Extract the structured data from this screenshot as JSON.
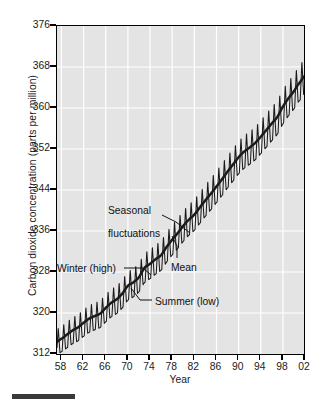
{
  "chart_data": {
    "type": "line",
    "title": "",
    "xlabel": "Year",
    "ylabel": "Carbon dioxide concentration (parts per million)",
    "xlim": [
      1957.2,
      2001.8
    ],
    "ylim": [
      312,
      376
    ],
    "grid": true,
    "legend_position": "none",
    "x_tick_labels": [
      "58",
      "62",
      "66",
      "70",
      "74",
      "78",
      "82",
      "86",
      "90",
      "94",
      "98",
      "02"
    ],
    "x_tick_values": [
      1958,
      1962,
      1966,
      1970,
      1974,
      1978,
      1982,
      1986,
      1990,
      1994,
      1998,
      2002
    ],
    "y_tick_labels": [
      "312",
      "320",
      "328",
      "336",
      "344",
      "352",
      "360",
      "368",
      "376"
    ],
    "y_tick_values": [
      312,
      320,
      328,
      336,
      344,
      352,
      360,
      368,
      376
    ],
    "series": [
      {
        "name": "Mean",
        "style": "thick-black-trend",
        "x": [
          1958,
          1959,
          1960,
          1961,
          1962,
          1963,
          1964,
          1965,
          1966,
          1967,
          1968,
          1969,
          1970,
          1971,
          1972,
          1973,
          1974,
          1975,
          1976,
          1977,
          1978,
          1979,
          1980,
          1981,
          1982,
          1983,
          1984,
          1985,
          1986,
          1987,
          1988,
          1989,
          1990,
          1991,
          1992,
          1993,
          1994,
          1995,
          1996,
          1997,
          1998,
          1999,
          2000,
          2001
        ],
        "values": [
          315.0,
          315.8,
          316.6,
          317.2,
          318.1,
          318.9,
          319.4,
          319.9,
          321.0,
          322.0,
          322.7,
          323.8,
          325.3,
          326.0,
          327.0,
          328.8,
          329.6,
          330.5,
          331.3,
          332.9,
          334.3,
          335.6,
          337.0,
          338.2,
          339.2,
          340.6,
          342.0,
          343.3,
          344.7,
          346.1,
          347.6,
          349.0,
          350.4,
          351.5,
          352.3,
          353.2,
          354.4,
          355.7,
          357.0,
          358.3,
          360.3,
          361.9,
          363.3,
          364.9
        ],
        "units": "ppm"
      },
      {
        "name": "Seasonal fluctuations",
        "style": "thin-oscillating",
        "description": "Annual sawtooth oscillation about the mean; winter peak, summer trough",
        "amplitude_ppm": 3.1,
        "winter_offset_ppm": 3.1,
        "summer_offset_ppm": -3.1
      }
    ],
    "annotations": [
      {
        "id": "seasonal",
        "text": "Seasonal\nfluctuations",
        "target_year": 1981.5,
        "target_ppm": 339.0
      },
      {
        "id": "winter",
        "text": "Winter (high)",
        "target_year": 1972.4,
        "target_ppm": 330.0
      },
      {
        "id": "mean",
        "text": "Mean",
        "target_year": 1982.5,
        "target_ppm": 340.0
      },
      {
        "id": "summer",
        "text": "Summer (low)",
        "target_year": 1972.2,
        "target_ppm": 324.0
      }
    ]
  },
  "axes": {
    "y_title": "Carbon dioxide concentration (parts per million)",
    "x_title": "Year"
  },
  "annotations": {
    "seasonal_line1": "Seasonal",
    "seasonal_line2": "fluctuations",
    "winter": "Winter (high)",
    "mean": "Mean",
    "summer": "Summer (low)"
  },
  "colors": {
    "plot_background": "#e4e4e4",
    "gridline": "#ffffff",
    "axis": "#000000",
    "curve": "#1a1a1a",
    "text": "#1a1a1a",
    "bottom_rule": "#3a3a3a"
  }
}
